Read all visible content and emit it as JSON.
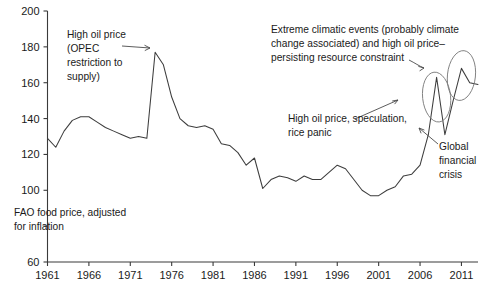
{
  "chart_data": {
    "type": "line",
    "title": "",
    "subtitle": "",
    "xlabel": "",
    "ylabel": "FAO food price, adjusted for inflation",
    "xlim": [
      1961,
      2013
    ],
    "ylim": [
      60,
      200
    ],
    "grid": false,
    "legend": "none",
    "y_ticks": [
      60,
      80,
      100,
      120,
      140,
      160,
      180,
      200
    ],
    "y_tick_labels": [
      "60",
      "",
      "100",
      "120",
      "140",
      "160",
      "180",
      "200"
    ],
    "x_ticks": [
      1961,
      1966,
      1971,
      1976,
      1981,
      1986,
      1991,
      1996,
      2001,
      2006,
      2011
    ],
    "x_tick_labels": [
      "1961",
      "1966",
      "1971",
      "1976",
      "1981",
      "1986",
      "1991",
      "1996",
      "2001",
      "2006",
      "2011"
    ],
    "series": [
      {
        "name": "FAO food price index, adjusted for inflation",
        "color": "#3d3d3d",
        "x": [
          1961,
          1962,
          1963,
          1964,
          1965,
          1966,
          1967,
          1968,
          1969,
          1970,
          1971,
          1972,
          1973,
          1974,
          1975,
          1976,
          1977,
          1978,
          1979,
          1980,
          1981,
          1982,
          1983,
          1984,
          1985,
          1986,
          1987,
          1988,
          1989,
          1990,
          1991,
          1992,
          1993,
          1994,
          1995,
          1996,
          1997,
          1998,
          1999,
          2000,
          2001,
          2002,
          2003,
          2004,
          2005,
          2006,
          2007,
          2008,
          2009,
          2010,
          2011,
          2012,
          2013
        ],
        "y": [
          129,
          124,
          133,
          139,
          141,
          141,
          138,
          135,
          133,
          131,
          129,
          130,
          129,
          177,
          170,
          152,
          140,
          136,
          135,
          136,
          134,
          126,
          125,
          121,
          114,
          118,
          101,
          106,
          108,
          107,
          105,
          108,
          106,
          106,
          110,
          114,
          112,
          106,
          100,
          97,
          97,
          100,
          102,
          108,
          109,
          114,
          131,
          163,
          131,
          150,
          168,
          160,
          159
        ]
      }
    ],
    "annotations": [
      {
        "id": "opec-annotation",
        "lines": [
          "High oil price",
          "(OPEC",
          "restriction to",
          "supply)"
        ],
        "text": "High oil price (OPEC restriction to supply)",
        "points_to_year": 1974,
        "points_to_value": 177
      },
      {
        "id": "climate-annotation",
        "lines": [
          "Extreme climatic events (probably climate",
          "change associated) and high oil price–",
          "persisting resource constraint"
        ],
        "text": "Extreme climatic events (probably climate change associated) and high oil price–persisting resource constraint",
        "points_to_year": 2011,
        "points_to_value": 168
      },
      {
        "id": "speculation-annotation",
        "lines": [
          "High oil price, speculation,",
          "rice panic"
        ],
        "text": "High oil price, speculation, rice panic",
        "points_to_year": 2008,
        "points_to_value": 163
      },
      {
        "id": "gfc-annotation",
        "lines": [
          "Global",
          "financial",
          "crisis"
        ],
        "text": "Global financial crisis",
        "points_to_year": 2009,
        "points_to_value": 131
      },
      {
        "id": "axis-caption",
        "lines": [
          "FAO food price, adjusted",
          "for inflation"
        ],
        "text": "FAO food price, adjusted for inflation"
      }
    ],
    "highlight_ellipses": [
      {
        "id": "ellipse-2008-spike",
        "center_year": 2008,
        "center_value": 152
      },
      {
        "id": "ellipse-2011-spike",
        "center_year": 2011,
        "center_value": 164
      }
    ]
  },
  "colors": {
    "series": "#3d3d3d",
    "axis": "#3a3a3a",
    "text": "#1a1a1a",
    "ellipse": "#7a7a7a",
    "background": "#ffffff"
  }
}
